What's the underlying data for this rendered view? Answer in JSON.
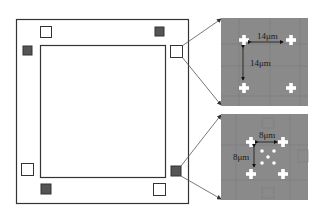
{
  "diagram": {
    "colors": {
      "frame": "#333333",
      "marker_dark": "#555555",
      "panel_bg": "#8a8a8a",
      "cross": "#ffffff",
      "connector": "#555555"
    },
    "chip": {
      "outer_frame": "outer-frame",
      "inner_square": "inner-square",
      "markers": [
        {
          "id": "top-left",
          "filled": false
        },
        {
          "id": "top-right",
          "filled": true
        },
        {
          "id": "left-upper",
          "filled": true
        },
        {
          "id": "right-upper",
          "filled": false
        },
        {
          "id": "left-lower",
          "filled": false
        },
        {
          "id": "right-lower",
          "filled": true
        },
        {
          "id": "bottom-left",
          "filled": true
        },
        {
          "id": "bottom-right",
          "filled": false
        }
      ]
    },
    "zoom_top": {
      "horizontal_label": "14μm",
      "vertical_label": "14μm"
    },
    "zoom_bottom": {
      "horizontal_label": "8μm",
      "vertical_label": "8μm"
    }
  }
}
